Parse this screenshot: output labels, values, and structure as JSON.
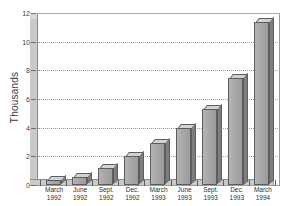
{
  "chart_data": {
    "type": "bar",
    "title": "",
    "subtitle": "",
    "xlabel": "",
    "ylabel": "Thousands",
    "ylim": [
      0,
      12
    ],
    "y_ticks": [
      0,
      2,
      4,
      6,
      8,
      10,
      12
    ],
    "y_tick_labels": [
      "0",
      "2",
      "4",
      "6",
      "8",
      "10",
      "12"
    ],
    "grid": true,
    "grid_axis": "y",
    "legend": false,
    "legend_position": "none",
    "style": "3d-bars",
    "bar_color": "#a8a8a8",
    "bar_top_color": "#d2d2d2",
    "bar_side_color": "#7e7e7e",
    "bar_edge_color": "#5d5d5d",
    "grid_color": "#9e9e9e",
    "axis_color": "#5d5d5d",
    "background_color": "#ffffff",
    "categories": [
      "March 1992",
      "June 1992",
      "Sept. 1992",
      "Dec. 1992",
      "March 1993",
      "June 1993",
      "Sept. 1993",
      "Dec. 1993",
      "March 1994"
    ],
    "category_lines": [
      [
        "March",
        "1992"
      ],
      [
        "June",
        "1992"
      ],
      [
        "Sept.",
        "1992"
      ],
      [
        "Dec.",
        "1992"
      ],
      [
        "March",
        "1993"
      ],
      [
        "June",
        "1993"
      ],
      [
        "Sept.",
        "1993"
      ],
      [
        "Dec.",
        "1993"
      ],
      [
        "March",
        "1994"
      ]
    ],
    "values": [
      0.35,
      0.55,
      1.2,
      2.0,
      2.9,
      4.0,
      5.3,
      7.5,
      11.35
    ],
    "units": "thousands"
  }
}
